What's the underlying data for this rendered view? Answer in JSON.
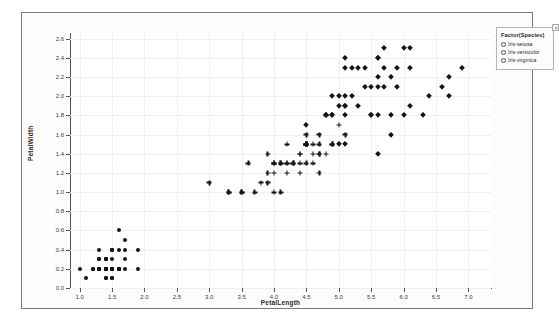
{
  "chart_data": {
    "type": "scatter",
    "title": "",
    "xlabel": "PetalLength",
    "ylabel": "PetalWidth",
    "xlim": [
      0.85,
      7.35
    ],
    "ylim": [
      0.0,
      2.66
    ],
    "xticks": [
      "1.0",
      "1.5",
      "2.0",
      "2.5",
      "3.0",
      "3.5",
      "4.0",
      "4.5",
      "5.0",
      "5.5",
      "6.0",
      "6.5",
      "7.0"
    ],
    "xtick_values": [
      1.0,
      1.5,
      2.0,
      2.5,
      3.0,
      3.5,
      4.0,
      4.5,
      5.0,
      5.5,
      6.0,
      6.5,
      7.0
    ],
    "yticks": [
      "0.0",
      "0.2",
      "0.4",
      "0.6",
      "0.8",
      "1.0",
      "1.2",
      "1.4",
      "1.6",
      "1.8",
      "2.0",
      "2.2",
      "2.4",
      "2.6"
    ],
    "ytick_values": [
      0.0,
      0.2,
      0.4,
      0.6,
      0.8,
      1.0,
      1.2,
      1.4,
      1.6,
      1.8,
      2.0,
      2.2,
      2.4,
      2.6
    ],
    "grid": true,
    "legend_position": "top-right",
    "marker_color": "#141414",
    "series": [
      {
        "name": "Iris-setosa",
        "marker": "circle",
        "points": [
          [
            1.4,
            0.2
          ],
          [
            1.4,
            0.2
          ],
          [
            1.3,
            0.2
          ],
          [
            1.5,
            0.2
          ],
          [
            1.4,
            0.2
          ],
          [
            1.7,
            0.4
          ],
          [
            1.4,
            0.3
          ],
          [
            1.5,
            0.2
          ],
          [
            1.4,
            0.2
          ],
          [
            1.5,
            0.1
          ],
          [
            1.5,
            0.2
          ],
          [
            1.6,
            0.2
          ],
          [
            1.4,
            0.1
          ],
          [
            1.1,
            0.1
          ],
          [
            1.2,
            0.2
          ],
          [
            1.5,
            0.4
          ],
          [
            1.3,
            0.4
          ],
          [
            1.4,
            0.3
          ],
          [
            1.7,
            0.3
          ],
          [
            1.5,
            0.3
          ],
          [
            1.7,
            0.2
          ],
          [
            1.5,
            0.4
          ],
          [
            1.0,
            0.2
          ],
          [
            1.7,
            0.5
          ],
          [
            1.9,
            0.2
          ],
          [
            1.6,
            0.2
          ],
          [
            1.6,
            0.4
          ],
          [
            1.5,
            0.2
          ],
          [
            1.4,
            0.2
          ],
          [
            1.6,
            0.2
          ],
          [
            1.6,
            0.2
          ],
          [
            1.5,
            0.4
          ],
          [
            1.5,
            0.1
          ],
          [
            1.4,
            0.2
          ],
          [
            1.5,
            0.2
          ],
          [
            1.2,
            0.2
          ],
          [
            1.3,
            0.2
          ],
          [
            1.4,
            0.1
          ],
          [
            1.3,
            0.2
          ],
          [
            1.5,
            0.2
          ],
          [
            1.3,
            0.3
          ],
          [
            1.3,
            0.3
          ],
          [
            1.3,
            0.2
          ],
          [
            1.6,
            0.6
          ],
          [
            1.9,
            0.4
          ],
          [
            1.4,
            0.3
          ],
          [
            1.6,
            0.2
          ],
          [
            1.4,
            0.2
          ],
          [
            1.5,
            0.2
          ],
          [
            1.4,
            0.2
          ]
        ]
      },
      {
        "name": "Iris-versicolor",
        "marker": "plus",
        "points": [
          [
            4.7,
            1.4
          ],
          [
            4.5,
            1.5
          ],
          [
            4.9,
            1.5
          ],
          [
            4.0,
            1.3
          ],
          [
            4.6,
            1.5
          ],
          [
            4.5,
            1.3
          ],
          [
            4.7,
            1.6
          ],
          [
            3.3,
            1.0
          ],
          [
            4.6,
            1.3
          ],
          [
            3.9,
            1.4
          ],
          [
            3.5,
            1.0
          ],
          [
            4.2,
            1.5
          ],
          [
            4.0,
            1.0
          ],
          [
            4.7,
            1.4
          ],
          [
            3.6,
            1.3
          ],
          [
            4.4,
            1.4
          ],
          [
            4.5,
            1.5
          ],
          [
            4.1,
            1.0
          ],
          [
            4.5,
            1.5
          ],
          [
            3.9,
            1.1
          ],
          [
            4.8,
            1.8
          ],
          [
            4.0,
            1.3
          ],
          [
            4.9,
            1.5
          ],
          [
            4.7,
            1.2
          ],
          [
            4.3,
            1.3
          ],
          [
            4.4,
            1.4
          ],
          [
            4.8,
            1.4
          ],
          [
            5.0,
            1.7
          ],
          [
            4.5,
            1.5
          ],
          [
            3.5,
            1.0
          ],
          [
            3.8,
            1.1
          ],
          [
            3.7,
            1.0
          ],
          [
            3.9,
            1.2
          ],
          [
            5.1,
            1.6
          ],
          [
            4.5,
            1.5
          ],
          [
            4.5,
            1.6
          ],
          [
            4.7,
            1.5
          ],
          [
            4.4,
            1.3
          ],
          [
            4.1,
            1.3
          ],
          [
            4.0,
            1.3
          ],
          [
            4.4,
            1.2
          ],
          [
            4.6,
            1.4
          ],
          [
            4.0,
            1.2
          ],
          [
            3.3,
            1.0
          ],
          [
            4.2,
            1.3
          ],
          [
            4.2,
            1.2
          ],
          [
            4.2,
            1.3
          ],
          [
            4.3,
            1.3
          ],
          [
            3.0,
            1.1
          ],
          [
            4.1,
            1.3
          ]
        ]
      },
      {
        "name": "Iris-virginica",
        "marker": "diamond",
        "points": [
          [
            6.0,
            2.5
          ],
          [
            5.1,
            1.9
          ],
          [
            5.9,
            2.1
          ],
          [
            5.6,
            1.8
          ],
          [
            5.8,
            2.2
          ],
          [
            6.6,
            2.1
          ],
          [
            4.5,
            1.7
          ],
          [
            6.3,
            1.8
          ],
          [
            5.8,
            1.8
          ],
          [
            6.1,
            2.5
          ],
          [
            5.1,
            2.0
          ],
          [
            5.3,
            1.9
          ],
          [
            5.5,
            2.1
          ],
          [
            5.0,
            2.0
          ],
          [
            5.1,
            2.4
          ],
          [
            5.3,
            2.3
          ],
          [
            5.5,
            1.8
          ],
          [
            6.7,
            2.2
          ],
          [
            6.9,
            2.3
          ],
          [
            5.0,
            1.5
          ],
          [
            5.7,
            2.3
          ],
          [
            4.9,
            2.0
          ],
          [
            6.7,
            2.0
          ],
          [
            4.9,
            1.8
          ],
          [
            5.7,
            2.1
          ],
          [
            6.0,
            1.8
          ],
          [
            4.8,
            1.8
          ],
          [
            4.9,
            1.8
          ],
          [
            5.6,
            2.1
          ],
          [
            5.8,
            1.6
          ],
          [
            6.1,
            1.9
          ],
          [
            6.4,
            2.0
          ],
          [
            5.6,
            2.2
          ],
          [
            5.1,
            1.5
          ],
          [
            5.6,
            1.4
          ],
          [
            6.1,
            2.3
          ],
          [
            5.6,
            2.4
          ],
          [
            5.5,
            1.8
          ],
          [
            4.8,
            1.8
          ],
          [
            5.4,
            2.1
          ],
          [
            5.6,
            2.4
          ],
          [
            5.1,
            2.3
          ],
          [
            5.1,
            1.9
          ],
          [
            5.9,
            2.3
          ],
          [
            5.7,
            2.5
          ],
          [
            5.2,
            2.3
          ],
          [
            5.0,
            1.9
          ],
          [
            5.2,
            2.0
          ],
          [
            5.4,
            2.3
          ],
          [
            5.1,
            1.8
          ]
        ]
      }
    ]
  },
  "legend": {
    "title": "Factor(Species)",
    "items": [
      {
        "label": "Iris-setosa"
      },
      {
        "label": "Iris-versicolor"
      },
      {
        "label": "Iris-virginica"
      }
    ]
  }
}
